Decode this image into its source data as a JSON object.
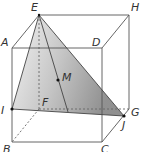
{
  "diagram": {
    "type": "geometry-cube",
    "colors": {
      "edge": "#555555",
      "hidden_edge": "#666666",
      "plane_light": "#e6e6e6",
      "plane_dark": "#8c8c8c",
      "point": "#111111"
    },
    "labels": {
      "A": "A",
      "B": "B",
      "C": "C",
      "D": "D",
      "E": "E",
      "F": "F",
      "G": "G",
      "H": "H",
      "I": "I",
      "J": "J",
      "M": "M"
    }
  }
}
